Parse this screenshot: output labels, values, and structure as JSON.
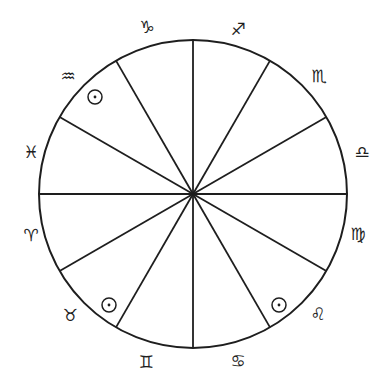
{
  "diagram": {
    "stroke_color": "#1e1e1e",
    "background": "#ffffff",
    "center": {
      "x": 193,
      "y": 194
    },
    "radius": 154,
    "spoke_count": 12,
    "spoke_step_deg": 30
  },
  "signs": [
    {
      "name": "capricorn",
      "glyph": "♑︎",
      "x": 147,
      "y": 27
    },
    {
      "name": "sagittarius",
      "glyph": "♐︎",
      "x": 238,
      "y": 29
    },
    {
      "name": "scorpio",
      "glyph": "♏︎",
      "x": 319,
      "y": 76
    },
    {
      "name": "libra",
      "glyph": "♎︎",
      "x": 362,
      "y": 152
    },
    {
      "name": "virgo",
      "glyph": "♍︎",
      "x": 358,
      "y": 234
    },
    {
      "name": "leo",
      "glyph": "♌︎",
      "x": 318,
      "y": 314
    },
    {
      "name": "cancer",
      "glyph": "♋︎",
      "x": 238,
      "y": 361
    },
    {
      "name": "gemini",
      "glyph": "♊︎",
      "x": 146,
      "y": 362
    },
    {
      "name": "taurus",
      "glyph": "♉︎",
      "x": 70,
      "y": 315
    },
    {
      "name": "aries",
      "glyph": "♈︎",
      "x": 31,
      "y": 235
    },
    {
      "name": "pisces",
      "glyph": "♓︎",
      "x": 31,
      "y": 152
    },
    {
      "name": "aquarius",
      "glyph": "♒︎",
      "x": 68,
      "y": 76
    }
  ],
  "sun_markers": [
    {
      "sector": "aquarius",
      "x": 95,
      "y": 97,
      "r": 7
    },
    {
      "sector": "taurus",
      "x": 109,
      "y": 305,
      "r": 7
    },
    {
      "sector": "leo",
      "x": 279,
      "y": 305,
      "r": 7
    }
  ]
}
